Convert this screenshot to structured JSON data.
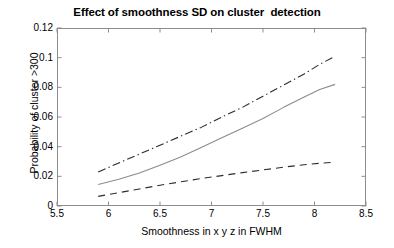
{
  "chart_data": {
    "type": "line",
    "title": "Effect of smoothness SD on cluster  detection",
    "xlabel": "Smoothness in x y z in FWHM",
    "ylabel": "Probability of cluster >300",
    "xlim": [
      5.5,
      8.5
    ],
    "ylim": [
      0,
      0.12
    ],
    "xticks": [
      "5.5",
      "6",
      "6.5",
      "7",
      "7.5",
      "8",
      "8.5"
    ],
    "xtick_values": [
      5.5,
      6,
      6.5,
      7,
      7.5,
      8,
      8.5
    ],
    "yticks": [
      "0",
      "0.02",
      "0.04",
      "0.06",
      "0.08",
      "0.1",
      "0.12"
    ],
    "ytick_values": [
      0,
      0.02,
      0.04,
      0.06,
      0.08,
      0.1,
      0.12
    ],
    "grid": false,
    "legend": "none",
    "series": [
      {
        "name": "upper bound",
        "style": "dash-dot",
        "color": "#2b2b2b",
        "x": [
          5.9,
          6.1,
          6.3,
          6.5,
          6.7,
          6.9,
          7.1,
          7.3,
          7.5,
          7.7,
          7.9,
          8.05,
          8.2
        ],
        "values": [
          0.023,
          0.029,
          0.035,
          0.041,
          0.047,
          0.053,
          0.06,
          0.0665,
          0.074,
          0.0815,
          0.089,
          0.0955,
          0.101
        ]
      },
      {
        "name": "mean estimate",
        "style": "solid",
        "color": "#8c8c8c",
        "x": [
          5.9,
          6.1,
          6.3,
          6.5,
          6.7,
          6.9,
          7.1,
          7.3,
          7.5,
          7.7,
          7.9,
          8.05,
          8.2
        ],
        "values": [
          0.0145,
          0.018,
          0.0222,
          0.0275,
          0.033,
          0.0395,
          0.046,
          0.0525,
          0.059,
          0.0665,
          0.0735,
          0.0785,
          0.082
        ]
      },
      {
        "name": "lower bound",
        "style": "dashed",
        "color": "#2b2b2b",
        "x": [
          5.9,
          6.1,
          6.3,
          6.5,
          6.7,
          6.9,
          7.1,
          7.3,
          7.5,
          7.7,
          7.9,
          8.05,
          8.2
        ],
        "values": [
          0.0065,
          0.009,
          0.0115,
          0.014,
          0.0163,
          0.0185,
          0.0205,
          0.0225,
          0.0243,
          0.0262,
          0.0278,
          0.0288,
          0.0295
        ]
      }
    ]
  }
}
